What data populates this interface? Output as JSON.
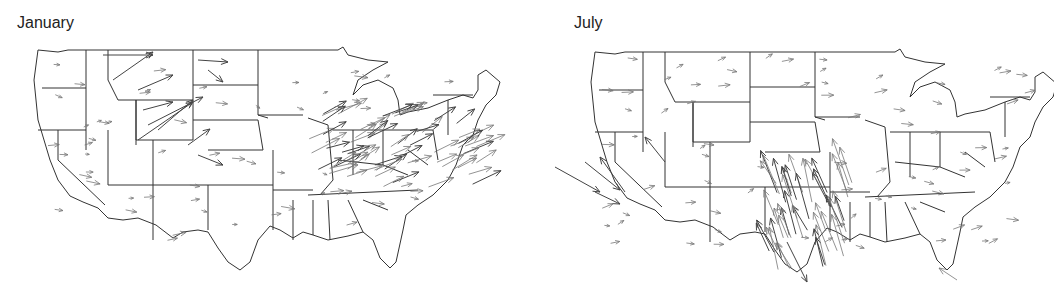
{
  "figure": {
    "type": "map",
    "panels": [
      {
        "id": "january",
        "title": "January"
      },
      {
        "id": "july",
        "title": "July"
      }
    ]
  },
  "panel_left": {
    "title": "January"
  },
  "panel_right": {
    "title": "July"
  },
  "colors": {
    "outline": "#333333",
    "arrow": "#777777",
    "background": "#ffffff"
  }
}
